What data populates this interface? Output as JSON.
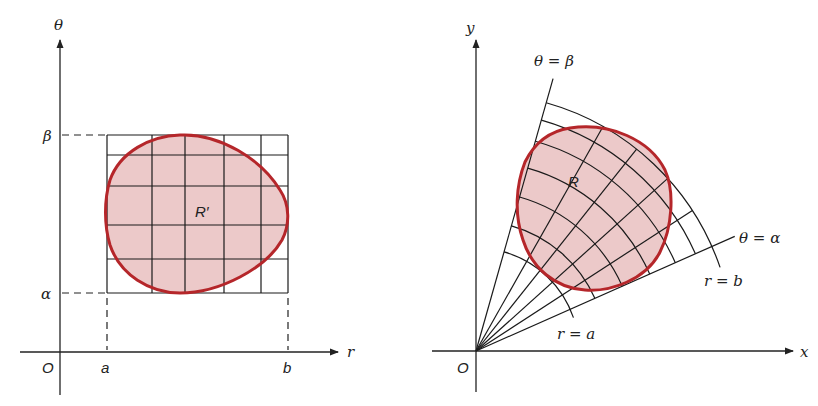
{
  "left_panel": {
    "title": "Region R' in the r-theta plane",
    "axes": {
      "vertical_label": "θ",
      "horizontal_label": "r",
      "origin_label": "O"
    },
    "tick_labels": {
      "alpha": "α",
      "beta": "β",
      "a": "a",
      "b": "b"
    },
    "region_label": "R′"
  },
  "right_panel": {
    "title": "Region R in the x-y plane",
    "axes": {
      "vertical_label": "y",
      "horizontal_label": "x",
      "origin_label": "O"
    },
    "ray_labels": {
      "beta": "θ = β",
      "alpha": "θ = α"
    },
    "arc_labels": {
      "a": "r = a",
      "b": "r = b"
    },
    "region_label": "R"
  },
  "colors": {
    "region_fill": "#ecc9c9",
    "region_stroke": "#b5262a",
    "lines": "#1a1a1a"
  }
}
